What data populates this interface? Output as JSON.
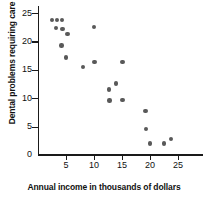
{
  "chart_data": {
    "type": "scatter",
    "title": "",
    "xlabel": "Annual income in thousands of dollars",
    "ylabel": "Dental problems requiring care",
    "xlim": [
      0,
      29
    ],
    "ylim": [
      0,
      26.5
    ],
    "xticks": [
      5,
      10,
      15,
      20,
      25
    ],
    "yticks": [
      5,
      10,
      15,
      20,
      25
    ],
    "origin_label": "0",
    "grid": false,
    "legend": null,
    "marker_color": "#595959",
    "axis_color": "#1a1a1a",
    "points": [
      {
        "x": 2.5,
        "y": 23.8
      },
      {
        "x": 3.4,
        "y": 23.8
      },
      {
        "x": 4.3,
        "y": 23.8
      },
      {
        "x": 3.2,
        "y": 22.4
      },
      {
        "x": 4.4,
        "y": 22.2
      },
      {
        "x": 5.3,
        "y": 21.3
      },
      {
        "x": 4.2,
        "y": 19.3
      },
      {
        "x": 5.0,
        "y": 17.2
      },
      {
        "x": 8.0,
        "y": 15.5
      },
      {
        "x": 10.0,
        "y": 22.5
      },
      {
        "x": 10.1,
        "y": 16.4
      },
      {
        "x": 12.7,
        "y": 11.5
      },
      {
        "x": 12.8,
        "y": 9.6
      },
      {
        "x": 13.9,
        "y": 12.6
      },
      {
        "x": 15.1,
        "y": 16.4
      },
      {
        "x": 15.1,
        "y": 9.7
      },
      {
        "x": 19.2,
        "y": 7.8
      },
      {
        "x": 19.3,
        "y": 4.6
      },
      {
        "x": 20.0,
        "y": 2.0
      },
      {
        "x": 22.5,
        "y": 2.0
      },
      {
        "x": 23.8,
        "y": 2.8
      }
    ]
  }
}
